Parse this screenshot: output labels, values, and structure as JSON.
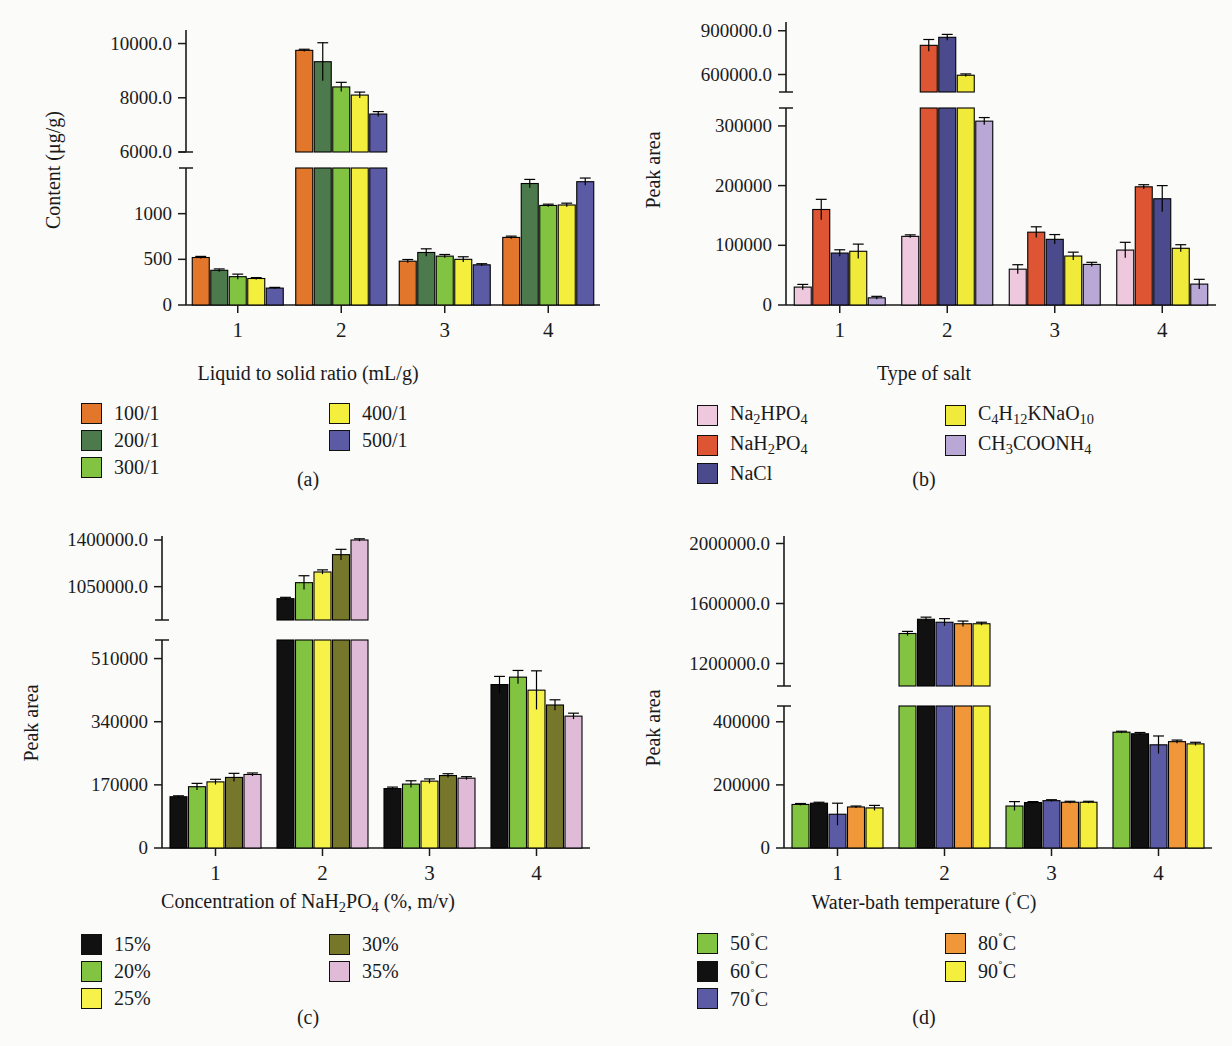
{
  "figure": {
    "panels": [
      {
        "id": "a",
        "caption": "(a)",
        "ylabel": "Content (μg/g)",
        "xlabel_html": "Liquid to solid ratio (mL/g)",
        "legend_title": "Liquid to solid ratio (mL/g)",
        "chart_data": {
          "type": "bar",
          "title": "",
          "xlabel": "Liquid to solid ratio (mL/g)",
          "ylabel": "Content (μg/g)",
          "categories": [
            "1",
            "2",
            "3",
            "4"
          ],
          "broken_axis": true,
          "lower_ticks": [
            0,
            500,
            1000
          ],
          "upper_ticks": [
            6000,
            8000,
            10000
          ],
          "lower_range": [
            0,
            1500
          ],
          "upper_range": [
            6000,
            10500
          ],
          "series": [
            {
              "name": "100/1",
              "color": "#E2762B",
              "values": [
                520,
                9750,
                480,
                740
              ],
              "errors": [
                12,
                40,
                18,
                14
              ]
            },
            {
              "name": "200/1",
              "color": "#4C7A4C",
              "values": [
                380,
                9330,
                575,
                1330
              ],
              "errors": [
                15,
                700,
                40,
                45
              ]
            },
            {
              "name": "300/1",
              "color": "#82C341",
              "values": [
                310,
                8400,
                535,
                1090
              ],
              "errors": [
                28,
                170,
                18,
                14
              ]
            },
            {
              "name": "400/1",
              "color": "#F4EF3C",
              "values": [
                290,
                8100,
                500,
                1095
              ],
              "errors": [
                10,
                110,
                28,
                20
              ]
            },
            {
              "name": "500/1",
              "color": "#5B5BA5",
              "values": [
                185,
                7400,
                440,
                1350
              ],
              "errors": [
                8,
                90,
                12,
                40
              ]
            }
          ]
        }
      },
      {
        "id": "b",
        "caption": "(b)",
        "ylabel": "Peak area",
        "xlabel_html": "Type of salt",
        "legend_title": "Type of salt",
        "chart_data": {
          "type": "bar",
          "title": "",
          "xlabel": "Type of salt",
          "ylabel": "Peak area",
          "categories": [
            "1",
            "2",
            "3",
            "4"
          ],
          "broken_axis": true,
          "lower_ticks": [
            0,
            100000,
            200000,
            300000
          ],
          "upper_ticks": [
            600000,
            900000
          ],
          "lower_range": [
            0,
            330000
          ],
          "upper_range": [
            480000,
            960000
          ],
          "series": [
            {
              "name": "Na2HPO4",
              "color": "#EEC9DD",
              "values": [
                30000,
                115000,
                60000,
                92000
              ],
              "errors": [
                4500,
                2500,
                7500,
                13000
              ]
            },
            {
              "name": "NaH2PO4",
              "color": "#DD5533",
              "values": [
                160000,
                800000,
                122000,
                198000
              ],
              "errors": [
                17000,
                40000,
                9000,
                3500
              ]
            },
            {
              "name": "NaCl",
              "color": "#4A4A8C",
              "values": [
                87000,
                855000,
                110000,
                178000
              ],
              "errors": [
                5500,
                20000,
                8000,
                22000
              ]
            },
            {
              "name": "C4H12KNaO10",
              "color": "#F0EB3A",
              "values": [
                90000,
                595000,
                82000,
                95000
              ],
              "errors": [
                12000,
                9000,
                6500,
                6000
              ]
            },
            {
              "name": "CH3COONH4",
              "color": "#B9A8D6",
              "values": [
                12000,
                308000,
                68000,
                35000
              ],
              "errors": [
                2500,
                6000,
                3500,
                8000
              ]
            }
          ]
        }
      },
      {
        "id": "c",
        "caption": "(c)",
        "ylabel": "Peak area",
        "xlabel_html": "Concentration of NaH<sub>2</sub>PO<sub>4</sub> (%, m/v)",
        "legend_title": "Concentration of NaH2PO4 (%, m/v)",
        "chart_data": {
          "type": "bar",
          "title": "",
          "xlabel": "Concentration of NaH2PO4 (%, m/v)",
          "ylabel": "Peak area",
          "categories": [
            "1",
            "2",
            "3",
            "4"
          ],
          "broken_axis": true,
          "lower_ticks": [
            0,
            170000,
            340000,
            510000
          ],
          "upper_ticks": [
            1050000,
            1400000
          ],
          "lower_range": [
            0,
            560000
          ],
          "upper_range": [
            800000,
            1430000
          ],
          "series": [
            {
              "name": "15%",
              "color": "#111111",
              "values": [
                138000,
                960000,
                160000,
                440000
              ],
              "errors": [
                2500,
                10000,
                4000,
                22000
              ]
            },
            {
              "name": "20%",
              "color": "#82C341",
              "values": [
                165000,
                1080000,
                172000,
                460000
              ],
              "errors": [
                9000,
                52000,
                9000,
                18000
              ]
            },
            {
              "name": "25%",
              "color": "#F7F24A",
              "values": [
                178000,
                1160000,
                180000,
                425000
              ],
              "errors": [
                7000,
                16000,
                6000,
                52000
              ]
            },
            {
              "name": "30%",
              "color": "#77772C",
              "values": [
                190000,
                1290000,
                195000,
                385000
              ],
              "errors": [
                11000,
                40000,
                5000,
                14000
              ]
            },
            {
              "name": "35%",
              "color": "#E0BBD8",
              "values": [
                198000,
                1400000,
                188000,
                355000
              ],
              "errors": [
                4000,
                9000,
                4000,
                8000
              ]
            }
          ]
        }
      },
      {
        "id": "d",
        "caption": "(d)",
        "ylabel": "Peak area",
        "xlabel_html": "Water-bath temperature (<sup>˚</sup>C)",
        "legend_title": "Water-bath temperature (˚C)",
        "chart_data": {
          "type": "bar",
          "title": "",
          "xlabel": "Water-bath temperature (˚C)",
          "ylabel": "Peak area",
          "categories": [
            "1",
            "2",
            "3",
            "4"
          ],
          "broken_axis": true,
          "lower_ticks": [
            0,
            200000,
            400000
          ],
          "upper_ticks": [
            1200000,
            1600000,
            2000000
          ],
          "lower_range": [
            0,
            450000
          ],
          "upper_range": [
            1050000,
            2050000
          ],
          "series": [
            {
              "name": "50˚C",
              "color": "#82C341",
              "values": [
                138000,
                1400000,
                133000,
                367000
              ],
              "errors": [
                3000,
                14000,
                14000,
                3000
              ]
            },
            {
              "name": "60˚C",
              "color": "#111111",
              "values": [
                142000,
                1495000,
                144000,
                362000
              ],
              "errors": [
                3000,
                14000,
                3000,
                4000
              ]
            },
            {
              "name": "70˚C",
              "color": "#5B5BA5",
              "values": [
                107000,
                1475000,
                150000,
                327000
              ],
              "errors": [
                35000,
                24000,
                3000,
                28000
              ]
            },
            {
              "name": "80˚C",
              "color": "#F0973A",
              "values": [
                130000,
                1465000,
                145000,
                337000
              ],
              "errors": [
                3000,
                18000,
                3000,
                5000
              ]
            },
            {
              "name": "90˚C",
              "color": "#F4EF3C",
              "values": [
                127000,
                1465000,
                145000,
                330000
              ],
              "errors": [
                8000,
                10000,
                3000,
                5000
              ]
            }
          ]
        }
      }
    ]
  },
  "legends": {
    "a": {
      "col1": [
        {
          "label": "100/1",
          "color": "#E2762B"
        },
        {
          "label": "200/1",
          "color": "#4C7A4C"
        },
        {
          "label": "300/1",
          "color": "#82C341"
        }
      ],
      "col2": [
        {
          "label": "400/1",
          "color": "#F4EF3C"
        },
        {
          "label": "500/1",
          "color": "#5B5BA5"
        }
      ]
    },
    "b": {
      "col1": [
        {
          "label_html": "Na<sub>2</sub>HPO<sub>4</sub>",
          "color": "#EEC9DD"
        },
        {
          "label_html": "NaH<sub>2</sub>PO<sub>4</sub>",
          "color": "#DD5533"
        },
        {
          "label_html": "NaCl",
          "color": "#4A4A8C"
        }
      ],
      "col2": [
        {
          "label_html": "C<sub>4</sub>H<sub>12</sub>KNaO<sub>10</sub>",
          "color": "#F0EB3A"
        },
        {
          "label_html": "CH<sub>3</sub>COONH<sub>4</sub>",
          "color": "#B9A8D6"
        }
      ]
    },
    "c": {
      "col1": [
        {
          "label": "15%",
          "color": "#111111"
        },
        {
          "label": "20%",
          "color": "#82C341"
        },
        {
          "label": "25%",
          "color": "#F7F24A"
        }
      ],
      "col2": [
        {
          "label": "30%",
          "color": "#77772C"
        },
        {
          "label": "35%",
          "color": "#E0BBD8"
        }
      ]
    },
    "d": {
      "col1": [
        {
          "label_html": "50<sup>˚</sup>C",
          "color": "#82C341"
        },
        {
          "label_html": "60<sup>˚</sup>C",
          "color": "#111111"
        },
        {
          "label_html": "70<sup>˚</sup>C",
          "color": "#5B5BA5"
        }
      ],
      "col2": [
        {
          "label_html": "80<sup>˚</sup>C",
          "color": "#F0973A"
        },
        {
          "label_html": "90<sup>˚</sup>C",
          "color": "#F4EF3C"
        }
      ]
    }
  },
  "axis_tick_text": {
    "a_upper": [
      "10000",
      "8000",
      "6000"
    ],
    "a_lower": [
      "1000",
      "500",
      "0"
    ],
    "b_upper": [
      "900000.0",
      "600000.0"
    ],
    "b_lower": [
      "300000",
      "200000",
      "100000",
      "0"
    ],
    "c_upper": [
      "1400000.0",
      "1050000.0"
    ],
    "c_lower": [
      "510000",
      "340000",
      "170000",
      "0"
    ],
    "d_upper": [
      "2000000.0",
      "1600000.0",
      "1200000.0"
    ],
    "d_lower": [
      "400000",
      "200000",
      "0"
    ]
  }
}
